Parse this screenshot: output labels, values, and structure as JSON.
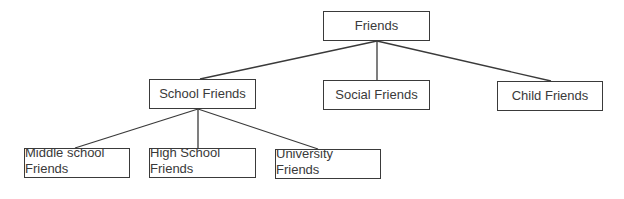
{
  "diagram": {
    "type": "tree",
    "colors": {
      "line": "#3a3a3a",
      "text": "#3a3a3a",
      "background": "#ffffff"
    },
    "root": {
      "label": "Friends"
    },
    "level1": [
      {
        "label": "School Friends"
      },
      {
        "label": "Social Friends"
      },
      {
        "label": "Child Friends"
      }
    ],
    "level2": [
      {
        "parent": "School Friends",
        "line1": "Middle school",
        "line2": "Friends"
      },
      {
        "parent": "School Friends",
        "line1": "High School",
        "line2": "Friends"
      },
      {
        "parent": "School Friends",
        "line1": "University",
        "line2": "Friends"
      }
    ]
  }
}
